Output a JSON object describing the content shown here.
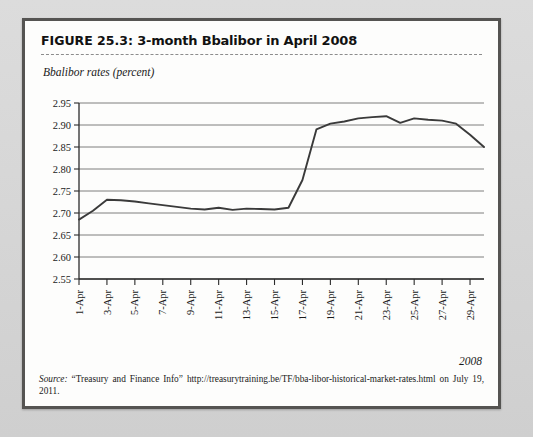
{
  "figure": {
    "label": "FIGURE 25.3:",
    "title": "3-month Bbalibor in April 2008",
    "axis_caption": "Bbalibor rates (percent)",
    "year_label": "2008",
    "source_word": "Source:",
    "source_text": " “Treasury and Finance Info” http://treasurytraining.be/TF/bba-libor-historical-market-rates.html on July 19, 2011."
  },
  "colors": {
    "page_background": "#d8d8d8",
    "figure_background": "#fdfdfc",
    "figure_border": "#555452",
    "line": "#3a3a3a",
    "gridline": "#6f6f6f",
    "axis": "#2b2b2b",
    "text": "#1a1a1a"
  },
  "chart_data": {
    "type": "line",
    "title": "3-month Bbalibor in April 2008",
    "xlabel": "2008",
    "ylabel": "Bbalibor rates (percent)",
    "ylim": [
      2.55,
      2.95
    ],
    "ytick_step": 0.05,
    "ytick_labels": [
      "2.95",
      "2.90",
      "2.85",
      "2.80",
      "2.75",
      "2.70",
      "2.65",
      "2.60",
      "2.55"
    ],
    "ytick_values": [
      2.95,
      2.9,
      2.85,
      2.8,
      2.75,
      2.7,
      2.65,
      2.6,
      2.55
    ],
    "grid": true,
    "grid_axis": "y",
    "legend": false,
    "xtick_labels": [
      "1-Apr",
      "3-Apr",
      "5-Apr",
      "7-Apr",
      "9-Apr",
      "11-Apr",
      "13-Apr",
      "15-Apr",
      "17-Apr",
      "19-Apr",
      "21-Apr",
      "23-Apr",
      "25-Apr",
      "27-Apr",
      "29-Apr"
    ],
    "xtick_label_rotation": -90,
    "x": [
      "1-Apr",
      "2-Apr",
      "3-Apr",
      "4-Apr",
      "5-Apr",
      "6-Apr",
      "7-Apr",
      "8-Apr",
      "9-Apr",
      "10-Apr",
      "11-Apr",
      "12-Apr",
      "13-Apr",
      "14-Apr",
      "15-Apr",
      "16-Apr",
      "17-Apr",
      "18-Apr",
      "19-Apr",
      "20-Apr",
      "21-Apr",
      "22-Apr",
      "23-Apr",
      "24-Apr",
      "25-Apr",
      "26-Apr",
      "27-Apr",
      "28-Apr",
      "29-Apr",
      "30-Apr"
    ],
    "series": [
      {
        "name": "3-month Bbalibor",
        "values": [
          2.685,
          2.705,
          2.73,
          2.729,
          2.726,
          2.722,
          2.718,
          2.714,
          2.71,
          2.708,
          2.712,
          2.707,
          2.71,
          2.709,
          2.708,
          2.712,
          2.775,
          2.89,
          2.903,
          2.908,
          2.915,
          2.918,
          2.92,
          2.905,
          2.915,
          2.912,
          2.91,
          2.903,
          2.878,
          2.85
        ]
      }
    ]
  }
}
